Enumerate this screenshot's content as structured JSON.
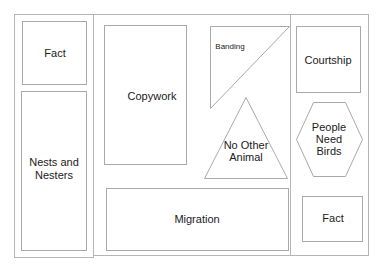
{
  "diagram": {
    "type": "lapbook-layout",
    "colors": {
      "stroke": "#a9a9a9",
      "text": "#1a1a1a",
      "background": "#ffffff"
    },
    "panels": {
      "left": {
        "items": [
          {
            "id": "fact-left",
            "shape": "rectangle",
            "label_lines": [
              "Fact"
            ]
          },
          {
            "id": "nests-and-nesters",
            "shape": "rectangle",
            "label_lines": [
              "Nests and",
              "Nesters"
            ]
          }
        ]
      },
      "center": {
        "items": [
          {
            "id": "copywork",
            "shape": "rectangle",
            "label_lines": [
              "Copywork"
            ]
          },
          {
            "id": "banding",
            "shape": "right-triangle",
            "label_lines": [
              "Banding"
            ]
          },
          {
            "id": "no-other-animal",
            "shape": "triangle",
            "label_lines": [
              "No Other",
              "Animal"
            ]
          },
          {
            "id": "migration",
            "shape": "rectangle",
            "label_lines": [
              "Migration"
            ]
          }
        ]
      },
      "right": {
        "items": [
          {
            "id": "courtship",
            "shape": "rectangle",
            "label_lines": [
              "Courtship"
            ]
          },
          {
            "id": "people-need-birds",
            "shape": "hexagon",
            "label_lines": [
              "People",
              "Need",
              "Birds"
            ]
          },
          {
            "id": "fact-right",
            "shape": "rectangle",
            "label_lines": [
              "Fact"
            ]
          }
        ]
      }
    }
  }
}
